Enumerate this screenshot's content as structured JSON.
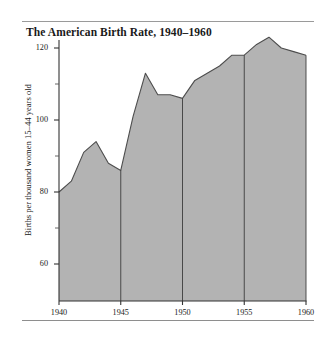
{
  "figure": {
    "title": "The American Birth Rate, 1940–1960",
    "has_top_rule": true,
    "has_bottom_rule": true,
    "background": "#ffffff"
  },
  "chart_data": {
    "type": "area",
    "title": "The American Birth Rate, 1940–1960",
    "subtitle": "",
    "xlabel": "",
    "ylabel": "Births per thousand women 15–44 years old",
    "xlim": [
      1940,
      1960
    ],
    "ylim": [
      50,
      126
    ],
    "grid": false,
    "legend": null,
    "area_fill": "#b3b3b3",
    "line_color": "#4d4d4d",
    "axis_color": "#333333",
    "x_ticks": [
      1940,
      1945,
      1950,
      1955,
      1960
    ],
    "x_tick_labels": [
      "1940",
      "1945",
      "1950",
      "1955",
      "1960"
    ],
    "y_ticks_major": [
      60,
      80,
      100,
      120
    ],
    "y_tick_labels": [
      "60",
      "80",
      "100",
      "120"
    ],
    "y_ticks_minor": [
      70,
      90,
      110
    ],
    "vertical_rules_at": [
      1945,
      1950,
      1955
    ],
    "x": [
      1940,
      1941,
      1942,
      1943,
      1944,
      1945,
      1946,
      1947,
      1948,
      1949,
      1950,
      1951,
      1952,
      1953,
      1954,
      1955,
      1956,
      1957,
      1958,
      1959,
      1960
    ],
    "values": [
      80,
      83,
      91,
      94,
      88,
      86,
      101,
      113,
      107,
      107,
      106,
      111,
      113,
      115,
      118,
      118,
      121,
      123,
      120,
      119,
      118
    ],
    "series": [
      {
        "name": "Births per thousand women 15–44 years old",
        "values": [
          80,
          83,
          91,
          94,
          88,
          86,
          101,
          113,
          107,
          107,
          106,
          111,
          113,
          115,
          118,
          118,
          121,
          123,
          120,
          119,
          118
        ]
      }
    ]
  }
}
